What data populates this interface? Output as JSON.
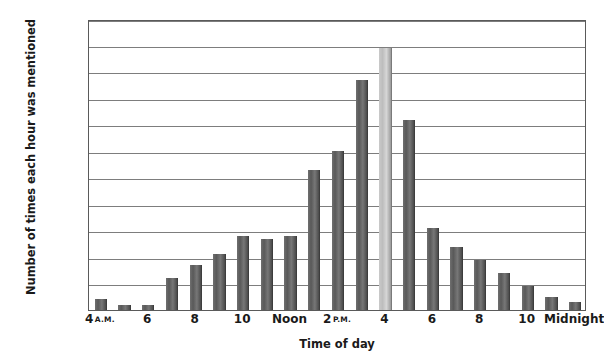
{
  "chart_data": {
    "type": "bar",
    "title": "",
    "xlabel": "Time of day",
    "ylabel": "Number of times each hour was mentioned",
    "ylim": [
      0,
      110
    ],
    "ytick_step": 10,
    "grid": true,
    "legend": "none",
    "categories": [
      "4 A.M.",
      "5",
      "6",
      "7",
      "8",
      "9",
      "10",
      "11",
      "Noon",
      "1 P.M.",
      "2 P.M.",
      "3",
      "4",
      "5",
      "6",
      "7",
      "8",
      "9",
      "10",
      "11",
      "Midnight"
    ],
    "values": [
      4,
      2,
      2,
      12,
      17,
      21,
      28,
      27,
      28,
      53,
      60,
      87,
      99,
      72,
      31,
      24,
      19,
      14,
      9,
      5,
      3
    ],
    "highlight_index": 12,
    "highlight_note": "4 P.M. bar rendered in light grey (peak value)",
    "bar_color": "#5c5c5c",
    "highlight_bar_color": "#c9c9c9",
    "gridline_color": "#7d7d7d",
    "axis_color": "#5a5a5a",
    "y_ticks": [
      "0",
      "10",
      "20",
      "30",
      "40",
      "50",
      "60",
      "70",
      "80",
      "90",
      "100",
      "110"
    ],
    "x_tick_labels": [
      {
        "index": 0,
        "text": "4",
        "ampm": "A.M."
      },
      {
        "index": 2,
        "text": "6",
        "ampm": ""
      },
      {
        "index": 4,
        "text": "8",
        "ampm": ""
      },
      {
        "index": 6,
        "text": "10",
        "ampm": ""
      },
      {
        "index": 8,
        "text": "Noon",
        "ampm": ""
      },
      {
        "index": 10,
        "text": "2",
        "ampm": "P.M."
      },
      {
        "index": 12,
        "text": "4",
        "ampm": ""
      },
      {
        "index": 14,
        "text": "6",
        "ampm": ""
      },
      {
        "index": 16,
        "text": "8",
        "ampm": ""
      },
      {
        "index": 18,
        "text": "10",
        "ampm": ""
      },
      {
        "index": 20,
        "text": "Midnight",
        "ampm": ""
      }
    ]
  }
}
